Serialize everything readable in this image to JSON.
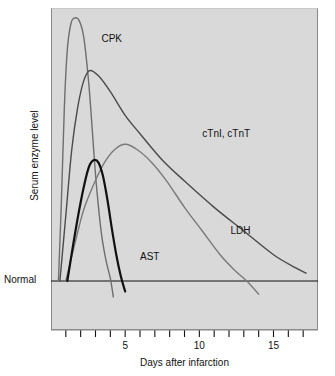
{
  "figure": {
    "background_color": "#ffffff",
    "plot_background_color": "#d9d9d9",
    "axis_color": "#111111"
  },
  "axes": {
    "y_axis_label": "Serum enzyme level",
    "x_axis_label": "Days after infarction",
    "baseline_label": "Normal"
  },
  "chart_data": {
    "type": "line",
    "title": "",
    "subtitle": "",
    "xlabel": "Days after infarction",
    "ylabel": "Serum enzyme level",
    "xlim": [
      0,
      18
    ],
    "ylim": [
      0,
      1.05
    ],
    "grid": false,
    "legend_position": "inline-annotations",
    "x_ticks": [
      1,
      2,
      3,
      4,
      5,
      6,
      7,
      8,
      9,
      10,
      11,
      12,
      13,
      14,
      15,
      16,
      17
    ],
    "x_tick_labels": [
      "",
      "",
      "",
      "",
      "5",
      "",
      "",
      "",
      "",
      "10",
      "",
      "",
      "",
      "",
      "15",
      "",
      ""
    ],
    "y_ticks": [],
    "y_tick_labels": [],
    "baseline_value": 0,
    "baseline_label": "Normal",
    "annotations": [
      {
        "text": "CPK",
        "x": 3.4,
        "y": 0.92
      },
      {
        "text": "cTnI, cTnT",
        "x": 10.2,
        "y": 0.56
      },
      {
        "text": "LDH",
        "x": 12.1,
        "y": 0.19
      },
      {
        "text": "AST",
        "x": 6.0,
        "y": 0.09
      }
    ],
    "series": [
      {
        "name": "CPK",
        "label": "CPK",
        "color": "#6e6e6e",
        "line_width": 1.4,
        "peak_day": 1.6,
        "peak_value": 1.0,
        "onset_day": 0.55,
        "return_to_normal_day": 4.2,
        "x": [
          0.5,
          0.7,
          0.9,
          1.1,
          1.35,
          1.6,
          1.9,
          2.2,
          2.5,
          2.7,
          2.9,
          3.1,
          3.4,
          3.7,
          4.0,
          4.2
        ],
        "values": [
          0.0,
          0.3,
          0.66,
          0.88,
          0.98,
          1.0,
          0.99,
          0.93,
          0.78,
          0.64,
          0.48,
          0.34,
          0.18,
          0.08,
          0.01,
          -0.06
        ]
      },
      {
        "name": "cTnI, cTnT",
        "label": "cTnI, cTnT",
        "color": "#4a4a4a",
        "line_width": 1.4,
        "peak_day": 2.6,
        "peak_value": 0.8,
        "onset_day": 0.6,
        "return_to_normal_day": 17.0,
        "x": [
          0.6,
          1.0,
          1.4,
          1.8,
          2.2,
          2.6,
          3.2,
          4.0,
          5.0,
          6.0,
          7.5,
          9.0,
          11.0,
          13.0,
          15.0,
          16.5,
          17.2
        ],
        "values": [
          0.0,
          0.25,
          0.5,
          0.66,
          0.76,
          0.8,
          0.78,
          0.72,
          0.63,
          0.56,
          0.46,
          0.38,
          0.28,
          0.19,
          0.1,
          0.05,
          0.03
        ]
      },
      {
        "name": "LDH",
        "label": "LDH",
        "color": "#7a7a7a",
        "line_width": 1.4,
        "peak_day": 5.0,
        "peak_value": 0.52,
        "onset_day": 1.0,
        "return_to_normal_day": 13.5,
        "x": [
          1.0,
          1.6,
          2.2,
          2.9,
          3.6,
          4.3,
          5.0,
          5.8,
          6.8,
          7.8,
          9.0,
          10.2,
          11.4,
          12.4,
          13.2,
          14.0
        ],
        "values": [
          0.0,
          0.14,
          0.27,
          0.37,
          0.45,
          0.5,
          0.52,
          0.5,
          0.45,
          0.38,
          0.28,
          0.19,
          0.1,
          0.04,
          0.0,
          -0.05
        ]
      },
      {
        "name": "AST",
        "label": "AST",
        "color": "#111111",
        "line_width": 2.2,
        "peak_day": 2.9,
        "peak_value": 0.46,
        "onset_day": 1.1,
        "return_to_normal_day": 4.7,
        "x": [
          1.1,
          1.5,
          1.9,
          2.3,
          2.6,
          2.9,
          3.2,
          3.5,
          3.8,
          4.1,
          4.4,
          4.7,
          5.0
        ],
        "values": [
          0.0,
          0.14,
          0.27,
          0.38,
          0.44,
          0.46,
          0.45,
          0.4,
          0.31,
          0.2,
          0.1,
          0.02,
          -0.04
        ]
      }
    ]
  }
}
